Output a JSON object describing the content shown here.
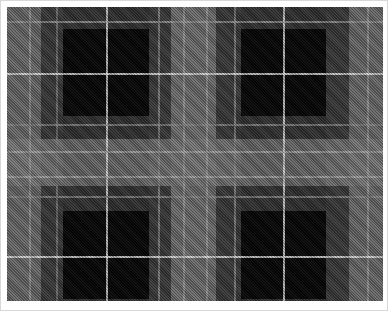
{
  "image": {
    "description": "Grayscale tartan plaid pattern",
    "colors": {
      "background": "#ffffff",
      "border": "#d8d8d8",
      "black": "#000000",
      "dark_gray": "#3a3a3a",
      "mid_gray": "#6e6e6e",
      "light_gray": "#8c8c8c",
      "white_line": "#e6e6e6"
    },
    "vertical_bands": [
      {
        "x": 0,
        "w": 34,
        "color": "#6a6a6a"
      },
      {
        "x": 34,
        "w": 22,
        "color": "#3a3a3a"
      },
      {
        "x": 56,
        "w": 86,
        "color": "#050505"
      },
      {
        "x": 142,
        "w": 22,
        "color": "#3a3a3a"
      },
      {
        "x": 164,
        "w": 45,
        "color": "#6e6e6e"
      },
      {
        "x": 209,
        "w": 25,
        "color": "#3a3a3a"
      },
      {
        "x": 234,
        "w": 85,
        "color": "#050505"
      },
      {
        "x": 319,
        "w": 23,
        "color": "#3a3a3a"
      },
      {
        "x": 342,
        "w": 34,
        "color": "#6a6a6a"
      }
    ],
    "horizontal_bands": [
      {
        "y": 0,
        "h": 22,
        "color": "#3a3a3a"
      },
      {
        "y": 22,
        "h": 87,
        "color": "#050505"
      },
      {
        "y": 109,
        "h": 23,
        "color": "#3a3a3a"
      },
      {
        "y": 132,
        "h": 47,
        "color": "#7a7a7a"
      },
      {
        "y": 179,
        "h": 25,
        "color": "#3a3a3a"
      },
      {
        "y": 204,
        "h": 88,
        "color": "#050505"
      },
      {
        "y": 292,
        "h": 2,
        "color": "#3a3a3a"
      }
    ],
    "vertical_lines": [
      {
        "x": 22,
        "color": "#9a9a9a"
      },
      {
        "x": 49,
        "color": "#7a7a7a"
      },
      {
        "x": 99,
        "color": "#e0e0e0"
      },
      {
        "x": 151,
        "color": "#8a8a8a"
      },
      {
        "x": 176,
        "color": "#9a9a9a"
      },
      {
        "x": 199,
        "color": "#9a9a9a"
      },
      {
        "x": 227,
        "color": "#8a8a8a"
      },
      {
        "x": 276,
        "color": "#e0e0e0"
      },
      {
        "x": 360,
        "color": "#9a9a9a"
      }
    ],
    "horizontal_lines": [
      {
        "y": 14,
        "color": "#9a9a9a"
      },
      {
        "y": 66,
        "color": "#e6e6e6"
      },
      {
        "y": 117,
        "color": "#8a8a8a"
      },
      {
        "y": 144,
        "color": "#a8a8a8"
      },
      {
        "y": 169,
        "color": "#a8a8a8"
      },
      {
        "y": 189,
        "color": "#8a8a8a"
      },
      {
        "y": 249,
        "color": "#e6e6e6"
      }
    ]
  }
}
